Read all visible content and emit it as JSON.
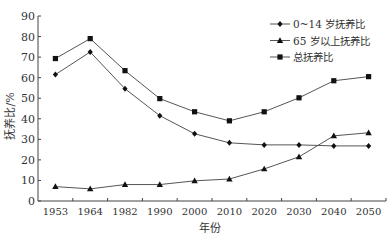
{
  "chart_data": {
    "type": "line",
    "title": "",
    "xlabel": "年份",
    "ylabel": "抚养比/%",
    "ylim": [
      0,
      90
    ],
    "yticks": [
      0,
      10,
      20,
      30,
      40,
      50,
      60,
      70,
      80,
      90
    ],
    "categories": [
      "1953",
      "1964",
      "1982",
      "1990",
      "2000",
      "2010",
      "2020",
      "2030",
      "2040",
      "2050"
    ],
    "grid": false,
    "legend_position": "upper right",
    "series": [
      {
        "name": "0~14 岁抚养比",
        "marker": "diamond",
        "values": [
          61.5,
          72.5,
          54.6,
          41.5,
          32.7,
          28.3,
          27.3,
          27.3,
          26.8,
          26.8
        ]
      },
      {
        "name": "65 岁以上抚养比",
        "marker": "triangle",
        "values": [
          7.0,
          5.9,
          8.0,
          8.0,
          9.8,
          10.7,
          15.6,
          21.5,
          31.7,
          33.2
        ]
      },
      {
        "name": "总抚养比",
        "marker": "square",
        "values": [
          69.3,
          79.0,
          63.4,
          49.8,
          43.4,
          39.0,
          43.4,
          50.2,
          58.5,
          60.5
        ]
      }
    ]
  }
}
